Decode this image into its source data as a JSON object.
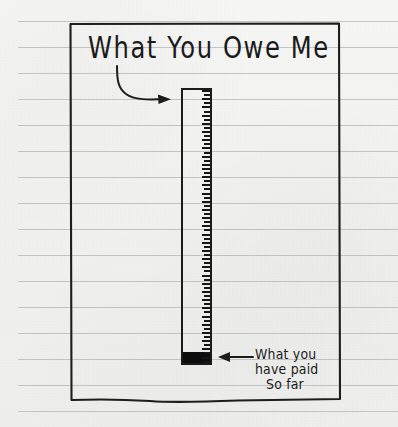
{
  "image": {
    "kind": "hand-drawn-chart-on-ruled-paper",
    "width": 398,
    "height": 427,
    "paper_color": "#f1f1ef",
    "rule_line_color": "#b9bcc0",
    "ink_color": "#1a1a1a"
  },
  "title": {
    "text": "What You Owe Me"
  },
  "annotation": {
    "line1": "What you",
    "line2": "have paid",
    "line3": "So far",
    "full_text": "What you have paid So far"
  },
  "chart_data": {
    "type": "bar",
    "title": "What You Owe Me",
    "orientation": "vertical",
    "categories": [
      "What you owe me"
    ],
    "series": [
      {
        "name": "What you have paid so far",
        "values": [
          4
        ],
        "color": "#0d0d0d"
      },
      {
        "name": "Remaining unpaid",
        "values": [
          96
        ],
        "color": "#f1f1ef"
      }
    ],
    "values": [
      4
    ],
    "ylim": [
      0,
      100
    ],
    "ylabel": "",
    "xlabel": "",
    "grid": false,
    "legend": false,
    "annotations": [
      {
        "text": "What You Owe Me",
        "points_to": "bar-outline",
        "arrow": "curved-right"
      },
      {
        "text": "What you have paid So far",
        "points_to": "bar-fill",
        "arrow": "straight-left"
      }
    ]
  },
  "rules": {
    "count": 16,
    "first_y": 21,
    "spacing": 26,
    "start_x": 18,
    "end_x": 398
  },
  "icons": {
    "arrow_to_bar": "curved-arrow-icon",
    "arrow_to_fill": "left-arrow-icon"
  }
}
